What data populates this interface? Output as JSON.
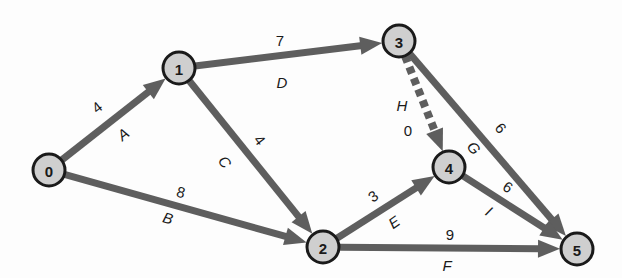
{
  "diagram": {
    "type": "activity-on-arrow network",
    "colors": {
      "edge": "#5e5e5e",
      "node_fill": "#cfcfcf",
      "node_stroke": "#1a1a1a",
      "text": "#1a1a1a"
    },
    "nodes": [
      {
        "id": "0",
        "label": "0",
        "x": 49,
        "y": 170
      },
      {
        "id": "1",
        "label": "1",
        "x": 179,
        "y": 68
      },
      {
        "id": "2",
        "label": "2",
        "x": 323,
        "y": 247
      },
      {
        "id": "3",
        "label": "3",
        "x": 399,
        "y": 41
      },
      {
        "id": "4",
        "label": "4",
        "x": 449,
        "y": 167
      },
      {
        "id": "5",
        "label": "5",
        "x": 577,
        "y": 249
      }
    ],
    "edges": [
      {
        "activity": "A",
        "duration": "4",
        "from": "0",
        "to": "1",
        "dummy": false,
        "duration_pos": [
          97,
          107
        ],
        "activity_pos": [
          123,
          134
        ],
        "angle": -38
      },
      {
        "activity": "B",
        "duration": "8",
        "from": "0",
        "to": "2",
        "dummy": false,
        "duration_pos": [
          181,
          192
        ],
        "activity_pos": [
          168,
          218
        ],
        "angle": 15
      },
      {
        "activity": "C",
        "duration": "4",
        "from": "1",
        "to": "2",
        "dummy": false,
        "duration_pos": [
          260,
          140
        ],
        "activity_pos": [
          225,
          162
        ],
        "angle": 52
      },
      {
        "activity": "D",
        "duration": "7",
        "from": "1",
        "to": "3",
        "dummy": false,
        "duration_pos": [
          280,
          40
        ],
        "activity_pos": [
          282,
          82
        ],
        "angle": 0
      },
      {
        "activity": "E",
        "duration": "3",
        "from": "2",
        "to": "4",
        "dummy": false,
        "duration_pos": [
          373,
          196
        ],
        "activity_pos": [
          394,
          222
        ],
        "angle": -35
      },
      {
        "activity": "F",
        "duration": "9",
        "from": "2",
        "to": "5",
        "dummy": false,
        "duration_pos": [
          450,
          234
        ],
        "activity_pos": [
          447,
          265
        ],
        "angle": 0
      },
      {
        "activity": "G",
        "duration": "6",
        "from": "3",
        "to": "5",
        "dummy": false,
        "duration_pos": [
          501,
          128
        ],
        "activity_pos": [
          474,
          148
        ],
        "angle": 50
      },
      {
        "activity": "H",
        "duration": "0",
        "from": "3",
        "to": "4",
        "dummy": true,
        "duration_pos": [
          408,
          130
        ],
        "activity_pos": [
          402,
          105
        ],
        "angle": 0
      },
      {
        "activity": "I",
        "duration": "6",
        "from": "4",
        "to": "5",
        "dummy": false,
        "duration_pos": [
          508,
          187
        ],
        "activity_pos": [
          489,
          211
        ],
        "angle": 33
      }
    ]
  }
}
